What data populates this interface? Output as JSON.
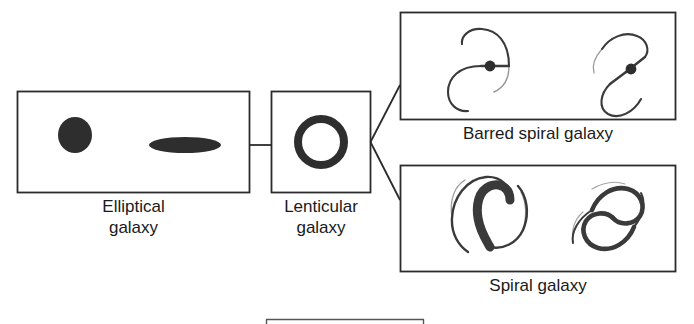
{
  "diagram": {
    "stroke_color": "#2b2b2b",
    "fill_color": "#2e2e2e",
    "background": "#ffffff",
    "panels": [
      {
        "id": "elliptical",
        "caption": "Elliptical\ngalaxy",
        "shapes": [
          "round-elliptical-galaxy",
          "elongated-elliptical-galaxy"
        ]
      },
      {
        "id": "lenticular",
        "caption": "Lenticular\ngalaxy",
        "shapes": [
          "lenticular-ring-galaxy"
        ]
      },
      {
        "id": "barred-spiral",
        "caption": "Barred spiral galaxy",
        "shapes": [
          "barred-spiral-galaxy-1",
          "barred-spiral-galaxy-2"
        ]
      },
      {
        "id": "spiral",
        "caption": "Spiral galaxy",
        "shapes": [
          "spiral-galaxy-1",
          "spiral-galaxy-2"
        ]
      }
    ],
    "connectors": [
      "elliptical-to-lenticular",
      "lenticular-to-barred-spiral",
      "lenticular-to-spiral"
    ],
    "footer_rule": "cropped-box-top-edge"
  }
}
